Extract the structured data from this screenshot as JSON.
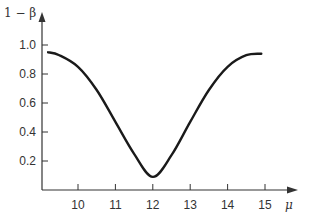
{
  "chart_data": {
    "type": "line",
    "title": "",
    "xlabel": "μ",
    "ylabel": "1 − β",
    "xlim": [
      9.0,
      15.8
    ],
    "ylim": [
      0,
      1.05
    ],
    "x_ticks": [
      "10",
      "11",
      "12",
      "13",
      "14",
      "15"
    ],
    "y_ticks": [
      "0.2",
      "0.4",
      "0.6",
      "0.8",
      "1.0"
    ],
    "grid": false,
    "legend": null,
    "series": [
      {
        "name": "power curve",
        "color": "#1a1a1a",
        "x": [
          9.2,
          9.5,
          10.0,
          10.5,
          11.0,
          11.5,
          12.0,
          12.5,
          13.0,
          13.5,
          14.0,
          14.5,
          14.9
        ],
        "values": [
          0.95,
          0.93,
          0.85,
          0.69,
          0.47,
          0.25,
          0.09,
          0.24,
          0.47,
          0.69,
          0.85,
          0.93,
          0.94
        ]
      }
    ]
  }
}
